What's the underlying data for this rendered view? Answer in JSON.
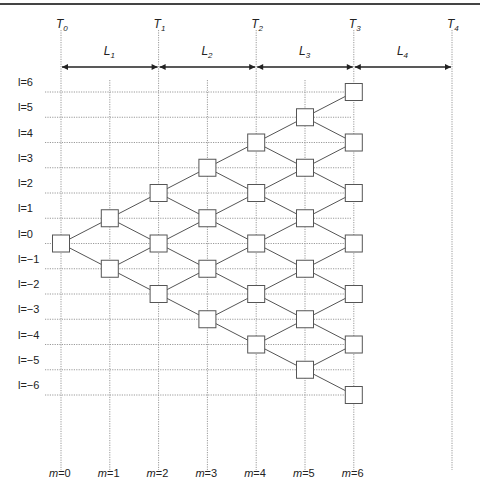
{
  "diagram": {
    "time_markers": [
      {
        "label": "T",
        "sub": "0",
        "m": 0
      },
      {
        "label": "T",
        "sub": "1",
        "m": 2
      },
      {
        "label": "T",
        "sub": "2",
        "m": 4
      },
      {
        "label": "T",
        "sub": "3",
        "m": 6
      },
      {
        "label": "T",
        "sub": "4",
        "m": 8
      }
    ],
    "periods": [
      {
        "label": "L",
        "sub": "1",
        "from": 0,
        "to": 2
      },
      {
        "label": "L",
        "sub": "2",
        "from": 2,
        "to": 4
      },
      {
        "label": "L",
        "sub": "3",
        "from": 4,
        "to": 6
      },
      {
        "label": "L",
        "sub": "4",
        "from": 6,
        "to": 8
      }
    ],
    "levels": [
      "l = 6",
      "l = 5",
      "l = 4",
      "l = 3",
      "l = 2",
      "l = 1",
      "l = 0",
      "l = −1",
      "l = −2",
      "l = −3",
      "l = −4",
      "l = −5",
      "l = −6"
    ],
    "level_values": [
      6,
      5,
      4,
      3,
      2,
      1,
      0,
      -1,
      -2,
      -3,
      -4,
      -5,
      -6
    ],
    "steps": [
      "m = 0",
      "m = 1",
      "m = 2",
      "m = 3",
      "m = 4",
      "m = 5",
      "m = 6"
    ],
    "nodes": [
      {
        "m": 0,
        "l": 0
      },
      {
        "m": 1,
        "l": 1
      },
      {
        "m": 1,
        "l": -1
      },
      {
        "m": 2,
        "l": 2
      },
      {
        "m": 2,
        "l": 0
      },
      {
        "m": 2,
        "l": -2
      },
      {
        "m": 3,
        "l": 3
      },
      {
        "m": 3,
        "l": 1
      },
      {
        "m": 3,
        "l": -1
      },
      {
        "m": 3,
        "l": -3
      },
      {
        "m": 4,
        "l": 4
      },
      {
        "m": 4,
        "l": 2
      },
      {
        "m": 4,
        "l": 0
      },
      {
        "m": 4,
        "l": -2
      },
      {
        "m": 4,
        "l": -4
      },
      {
        "m": 5,
        "l": 5
      },
      {
        "m": 5,
        "l": 3
      },
      {
        "m": 5,
        "l": 1
      },
      {
        "m": 5,
        "l": -1
      },
      {
        "m": 5,
        "l": -3
      },
      {
        "m": 5,
        "l": -5
      },
      {
        "m": 6,
        "l": 6
      },
      {
        "m": 6,
        "l": 4
      },
      {
        "m": 6,
        "l": 2
      },
      {
        "m": 6,
        "l": 0
      },
      {
        "m": 6,
        "l": -2
      },
      {
        "m": 6,
        "l": -4
      },
      {
        "m": 6,
        "l": -6
      }
    ],
    "colors": {
      "line": "#555555",
      "grid": "#9a9a9a",
      "box_stroke": "#555555",
      "arrow": "#222222",
      "border": "#444444"
    }
  }
}
